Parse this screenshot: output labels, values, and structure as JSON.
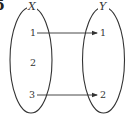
{
  "figure": {
    "corner_label": "5",
    "type": "mapping-diagram",
    "colors": {
      "stroke": "#333333",
      "background": "#ffffff"
    }
  },
  "sets": [
    {
      "name": "X",
      "elements": [
        "1",
        "2",
        "3"
      ]
    },
    {
      "name": "Y",
      "elements": [
        "1",
        "2"
      ]
    }
  ],
  "mappings": [
    {
      "from": "1",
      "to": "1"
    },
    {
      "from": "3",
      "to": "2"
    }
  ]
}
